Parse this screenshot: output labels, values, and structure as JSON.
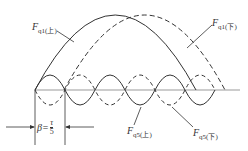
{
  "diagram": {
    "labels": {
      "fq1_upper": {
        "main": "F",
        "sub": "q1(上)"
      },
      "fq1_lower": {
        "main": "F",
        "sub": "q1(下)"
      },
      "fq5_upper": {
        "main": "F",
        "sub": "q5(上)"
      },
      "fq5_lower": {
        "main": "F",
        "sub": "q5(下)"
      }
    },
    "beta": {
      "symbol": "β=",
      "numerator": "τ",
      "denominator": "5"
    },
    "colors": {
      "line": "#333333",
      "axis": "#999999"
    }
  }
}
